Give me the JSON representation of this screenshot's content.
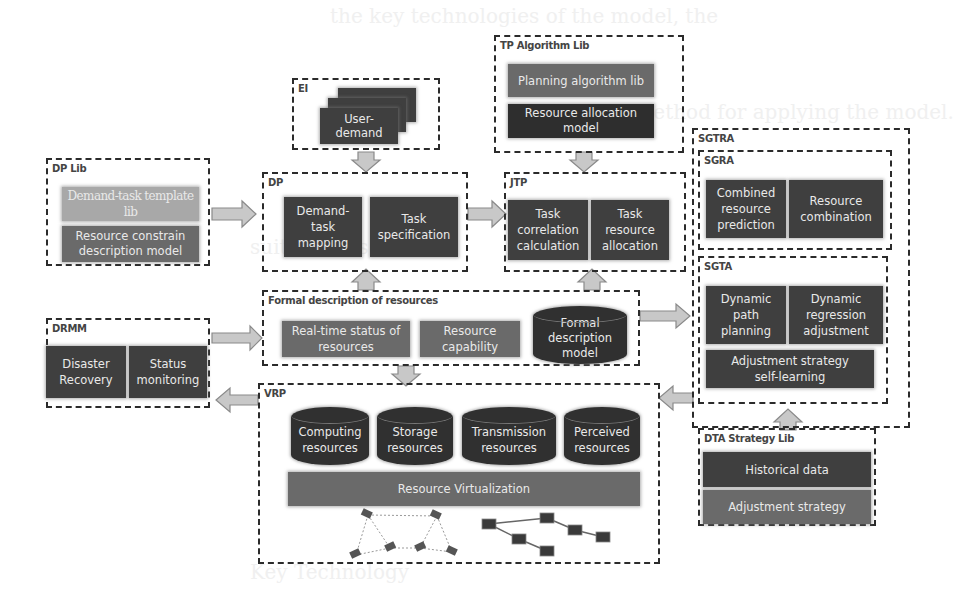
{
  "background_text": {
    "lines": [
      "the key technologies of the model, the",
      "fective method for applying the model.",
      "suitable res",
      "Key Technology"
    ]
  },
  "groups": {
    "ei": {
      "label": "EI",
      "item": "User-\ndemand"
    },
    "tp_lib": {
      "label": "TP Algorithm Lib",
      "items": [
        "Planning algorithm lib",
        "Resource allocation\nmodel"
      ]
    },
    "dp_lib": {
      "label": "DP Lib",
      "items": [
        "Demand-task template lib",
        "Resource constrain\ndescription model"
      ]
    },
    "dp": {
      "label": "DP",
      "items": [
        "Demand-\ntask\nmapping",
        "Task\nspecification"
      ]
    },
    "jtp": {
      "label": "JTP",
      "items": [
        "Task\ncorrelation\ncalculation",
        "Task\nresource\nallocation"
      ]
    },
    "sgtra": {
      "label": "SGTRA"
    },
    "sgra": {
      "label": "SGRA",
      "items": [
        "Combined\nresource\nprediction",
        "Resource\ncombination"
      ]
    },
    "sgta": {
      "label": "SGTA",
      "items": [
        "Dynamic\npath\nplanning",
        "Dynamic\nregression\nadjustment",
        "Adjustment strategy\nself-learning"
      ]
    },
    "fdr": {
      "label": "Formal description of resources",
      "items": [
        "Real-time status of\nresources",
        "Resource\ncapability",
        "Formal\ndescription\nmodel"
      ]
    },
    "drmm": {
      "label": "DRMM",
      "items": [
        "Disaster\nRecovery",
        "Status\nmonitoring"
      ]
    },
    "vrp": {
      "label": "VRP",
      "items": [
        "Computing\nresources",
        "Storage\nresources",
        "Transmission\nresources",
        "Perceived\nresources"
      ],
      "base": "Resource Virtualization"
    },
    "dta_lib": {
      "label": "DTA Strategy Lib",
      "items": [
        "Historical data",
        "Adjustment strategy"
      ]
    }
  },
  "colors": {
    "dark_box": "#3f3f3f",
    "darker_box": "#2e2e2e",
    "mid_box": "#6a6a6a",
    "light_box": "#9a9a9a",
    "arrow_fill": "#c8c8c8",
    "arrow_stroke": "#8a8a8a",
    "dash_border": "#2b2b2b"
  }
}
